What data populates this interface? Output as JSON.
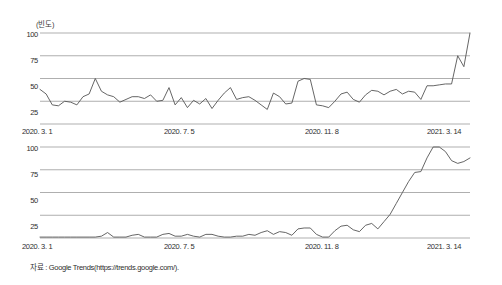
{
  "figure": {
    "source_note": "자료 : Google Trends(https://trends.google.com/).",
    "axis_unit_label": "(빈도)"
  },
  "chart_data": [
    {
      "type": "line",
      "id": "chart-top",
      "title": "",
      "subtitle": "",
      "xlabel": "",
      "ylabel": "(빈도)",
      "ylim": [
        0,
        100
      ],
      "xlim": [
        0,
        54
      ],
      "grid": true,
      "gridlines_y": [
        25,
        50,
        75,
        100
      ],
      "legend": "none",
      "yticks": [
        100,
        75,
        50,
        25
      ],
      "ytick_labels": [
        "100",
        "75",
        "50",
        "25"
      ],
      "xticks": [
        0,
        18,
        36,
        54
      ],
      "xtick_labels": [
        "2020. 3. 1",
        "2020. 7. 5",
        "2020. 11. 8",
        "2021. 3. 14"
      ],
      "line_color": "#555555",
      "values": [
        38,
        33,
        21,
        20,
        25,
        24,
        21,
        30,
        33,
        50,
        36,
        32,
        30,
        24,
        27,
        30,
        30,
        28,
        32,
        25,
        26,
        40,
        21,
        29,
        18,
        26,
        22,
        28,
        17,
        26,
        34,
        40,
        27,
        29,
        30,
        26,
        21,
        16,
        34,
        30,
        22,
        23,
        47,
        50,
        49,
        21,
        20,
        18,
        25,
        33,
        35,
        27,
        24,
        32,
        37,
        36,
        32,
        36,
        38,
        33,
        36,
        35,
        27,
        42,
        42,
        43,
        44,
        44,
        75,
        63,
        100
      ]
    },
    {
      "type": "line",
      "id": "chart-bottom",
      "title": "",
      "subtitle": "",
      "xlabel": "",
      "ylabel": "",
      "ylim": [
        0,
        100
      ],
      "xlim": [
        0,
        54
      ],
      "grid": true,
      "gridlines_y": [
        25,
        50,
        75,
        100
      ],
      "legend": "none",
      "yticks": [
        100,
        75,
        50,
        25
      ],
      "ytick_labels": [
        "100",
        "75",
        "50",
        "25"
      ],
      "xticks": [
        0,
        18,
        36,
        54
      ],
      "xtick_labels": [
        "2020. 3. 1",
        "2020. 7. 5",
        "2020. 11. 8",
        "2021. 3. 14"
      ],
      "line_color": "#555555",
      "values": [
        1,
        1,
        1,
        1,
        1,
        1,
        1,
        1,
        1,
        1,
        2,
        6,
        1,
        1,
        1,
        3,
        4,
        1,
        1,
        1,
        4,
        5,
        2,
        2,
        4,
        2,
        1,
        4,
        4,
        2,
        1,
        1,
        2,
        2,
        4,
        3,
        6,
        8,
        4,
        7,
        6,
        3,
        10,
        11,
        11,
        4,
        1,
        1,
        8,
        13,
        14,
        9,
        7,
        14,
        16,
        10,
        18,
        26,
        38,
        50,
        62,
        72,
        73,
        88,
        100,
        100,
        95,
        85,
        82,
        84,
        88
      ]
    }
  ]
}
